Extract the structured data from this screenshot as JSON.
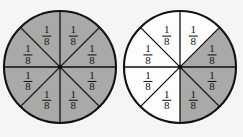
{
  "figure": {
    "background_color": "#f5f5f3",
    "shaded_color": "#a9a9a7",
    "blank_color": "#fdfdfc",
    "line_color": "#111111",
    "label_text": "1/8",
    "numerator": "1",
    "denominator": "8",
    "circles": [
      {
        "id": "left-circle",
        "name": "fraction-circle-left",
        "center_x": 60,
        "center_y": 67,
        "radius": 56,
        "total_parts": 8,
        "shaded_parts": 8,
        "fraction_shaded": "8/8",
        "sectors": [
          {
            "index": 0,
            "start_deg": -90,
            "end_deg": -45,
            "shaded": true,
            "label": "1/8"
          },
          {
            "index": 1,
            "start_deg": -45,
            "end_deg": 0,
            "shaded": true,
            "label": "1/8"
          },
          {
            "index": 2,
            "start_deg": 0,
            "end_deg": 45,
            "shaded": true,
            "label": "1/8"
          },
          {
            "index": 3,
            "start_deg": 45,
            "end_deg": 90,
            "shaded": true,
            "label": "1/8"
          },
          {
            "index": 4,
            "start_deg": 90,
            "end_deg": 135,
            "shaded": true,
            "label": "1/8"
          },
          {
            "index": 5,
            "start_deg": 135,
            "end_deg": 180,
            "shaded": true,
            "label": "1/8"
          },
          {
            "index": 6,
            "start_deg": 180,
            "end_deg": 225,
            "shaded": true,
            "label": "1/8"
          },
          {
            "index": 7,
            "start_deg": 225,
            "end_deg": 270,
            "shaded": true,
            "label": "1/8"
          }
        ]
      },
      {
        "id": "right-circle",
        "name": "fraction-circle-right",
        "center_x": 180,
        "center_y": 67,
        "radius": 56,
        "total_parts": 8,
        "shaded_parts": 3,
        "fraction_shaded": "3/8",
        "sectors": [
          {
            "index": 0,
            "start_deg": -90,
            "end_deg": -45,
            "shaded": false,
            "label": "1/8"
          },
          {
            "index": 1,
            "start_deg": -45,
            "end_deg": 0,
            "shaded": true,
            "label": "1/8"
          },
          {
            "index": 2,
            "start_deg": 0,
            "end_deg": 45,
            "shaded": true,
            "label": "1/8"
          },
          {
            "index": 3,
            "start_deg": 45,
            "end_deg": 90,
            "shaded": true,
            "label": "1/8"
          },
          {
            "index": 4,
            "start_deg": 90,
            "end_deg": 135,
            "shaded": false,
            "label": "1/8"
          },
          {
            "index": 5,
            "start_deg": 135,
            "end_deg": 180,
            "shaded": false,
            "label": "1/8"
          },
          {
            "index": 6,
            "start_deg": 180,
            "end_deg": 225,
            "shaded": false,
            "label": "1/8"
          },
          {
            "index": 7,
            "start_deg": 225,
            "end_deg": 270,
            "shaded": false,
            "label": "1/8"
          }
        ]
      }
    ]
  }
}
